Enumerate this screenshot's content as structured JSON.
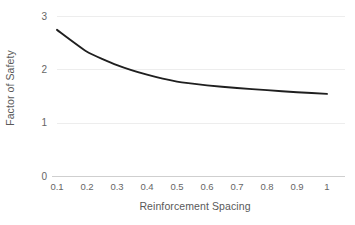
{
  "chart_data": {
    "type": "line",
    "title": "",
    "subtitle": "",
    "xlabel": "Reinforcement Spacing",
    "ylabel": "Factor of Safety",
    "x": [
      0.1,
      0.2,
      0.3,
      0.4,
      0.5,
      0.6,
      0.7,
      0.8,
      0.9,
      1.0
    ],
    "values": [
      2.74,
      2.33,
      2.08,
      1.9,
      1.77,
      1.7,
      1.65,
      1.61,
      1.57,
      1.54
    ],
    "series": [
      {
        "name": "Factor of Safety",
        "values": [
          2.74,
          2.33,
          2.08,
          1.9,
          1.77,
          1.7,
          1.65,
          1.61,
          1.57,
          1.54
        ],
        "color": "#1f1f1f"
      }
    ],
    "xlim": [
      0.1,
      1.06
    ],
    "ylim": [
      0,
      3
    ],
    "xticks": [
      0.1,
      0.2,
      0.3,
      0.4,
      0.5,
      0.6,
      0.7,
      0.8,
      0.9,
      1.0
    ],
    "xtick_labels": [
      "0.1",
      "0.2",
      "0.3",
      "0.4",
      "0.5",
      "0.6",
      "0.7",
      "0.8",
      "0.9",
      "1"
    ],
    "yticks": [
      0,
      1,
      2,
      3
    ],
    "ytick_labels": [
      "0",
      "1",
      "2",
      "3"
    ],
    "grid": true,
    "grid_axis": "y",
    "grid_color": "#ededed",
    "axis_color": "#cfcfcf",
    "tick_text_color": "#666666",
    "axis_title_color": "#595959",
    "legend": false,
    "legend_position": "none",
    "annotations": []
  }
}
